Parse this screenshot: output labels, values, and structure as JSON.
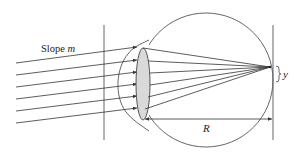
{
  "diagram": {
    "labels": {
      "slope_prefix": "Slope ",
      "slope_var": "m",
      "displacement": "y",
      "distance": "R"
    },
    "elements": {
      "incoming_rays": 6,
      "lens": "biconvex lens (shaded)",
      "eyeball": "circle",
      "cornea": "bulging front curve",
      "left_reference_line": "vertical line",
      "retina_plane": "vertical line",
      "focal_point": "rays converge on retina"
    },
    "colors": {
      "stroke": "#4a4a4a",
      "lens_fill": "#d9d9d9",
      "background": "#ffffff"
    }
  }
}
